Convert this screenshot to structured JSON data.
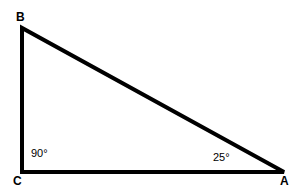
{
  "figure": {
    "type": "geometry-diagram",
    "shape": "right-triangle",
    "background_color": "#ffffff",
    "stroke_color": "#000000",
    "width": 301,
    "height": 192
  },
  "vertices": {
    "B": {
      "label": "B",
      "x": 22,
      "y": 28
    },
    "C": {
      "label": "C",
      "x": 22,
      "y": 172
    },
    "A": {
      "label": "A",
      "x": 284,
      "y": 172
    }
  },
  "angles": {
    "at_C": {
      "label": "90°",
      "value": 90,
      "unit": "degrees"
    },
    "at_A": {
      "label": "25°",
      "value": 25,
      "unit": "degrees"
    }
  }
}
